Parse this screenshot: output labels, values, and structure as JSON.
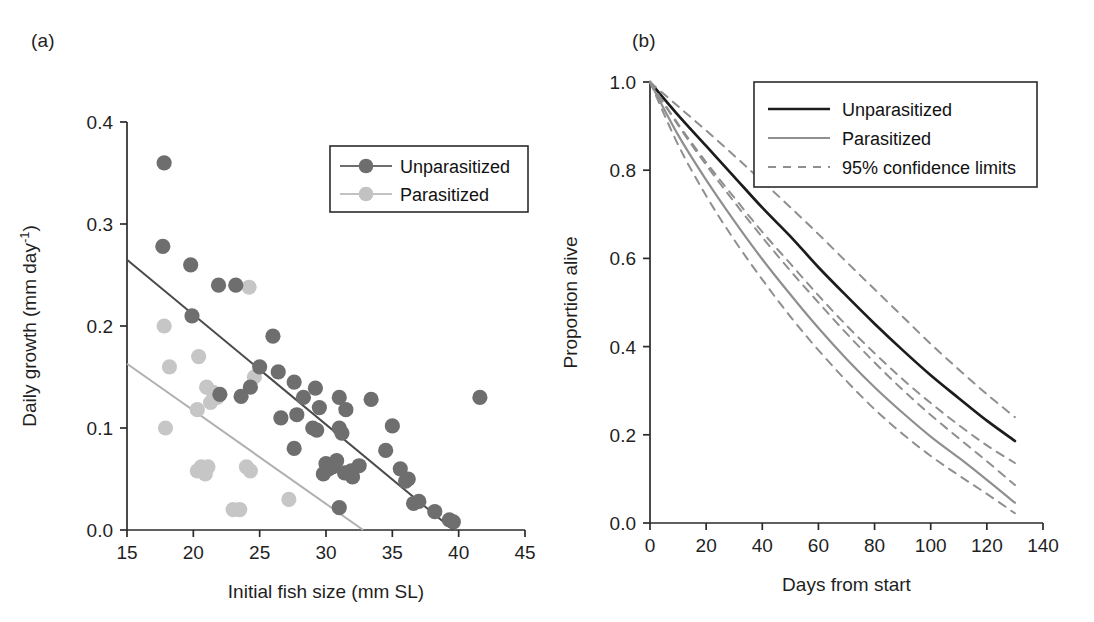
{
  "figure": {
    "panels": [
      {
        "label": "(a)"
      },
      {
        "label": "(b)"
      }
    ]
  },
  "panel_a": {
    "label": "(a)",
    "legend": {
      "items": [
        {
          "label": "Unparasitized",
          "color": "#6e6e6e"
        },
        {
          "label": "Parasitized",
          "color": "#c2c2c2"
        }
      ]
    }
  },
  "panel_b": {
    "label": "(b)",
    "legend": {
      "items": [
        {
          "label": "Unparasitized",
          "color": "#1c1c1c",
          "style": "solid"
        },
        {
          "label": "Parasitized",
          "color": "#8f8f8f",
          "style": "solid"
        },
        {
          "label": "95% confidence limits",
          "color": "#8f8f8f",
          "style": "dashed"
        }
      ]
    }
  },
  "chart_data": [
    {
      "id": "panel-a",
      "type": "scatter",
      "title": "",
      "panel_label": "(a)",
      "xlabel": "Initial fish size (mm SL)",
      "ylabel": "Daily growth (mm day⁻¹)",
      "xlim": [
        15,
        45
      ],
      "ylim": [
        0.0,
        0.4
      ],
      "xticks": [
        15,
        20,
        25,
        30,
        35,
        40,
        45
      ],
      "xtick_labels": [
        "15",
        "20",
        "25",
        "30",
        "35",
        "40",
        "45"
      ],
      "yticks": [
        0.0,
        0.1,
        0.2,
        0.3,
        0.4
      ],
      "ytick_labels": [
        "0.0",
        "0.1",
        "0.2",
        "0.3",
        "0.4"
      ],
      "grid": false,
      "legend_position": "top-right",
      "series": [
        {
          "name": "Unparasitized",
          "color": "#6e6e6e",
          "marker": "circle",
          "points": [
            [
              17.8,
              0.36
            ],
            [
              17.7,
              0.278
            ],
            [
              19.8,
              0.26
            ],
            [
              19.9,
              0.21
            ],
            [
              21.9,
              0.24
            ],
            [
              23.2,
              0.24
            ],
            [
              23.6,
              0.131
            ],
            [
              24.3,
              0.14
            ],
            [
              22.0,
              0.133
            ],
            [
              25.0,
              0.16
            ],
            [
              26.0,
              0.19
            ],
            [
              26.4,
              0.155
            ],
            [
              27.6,
              0.145
            ],
            [
              28.3,
              0.13
            ],
            [
              26.6,
              0.11
            ],
            [
              27.8,
              0.113
            ],
            [
              27.6,
              0.08
            ],
            [
              29.2,
              0.139
            ],
            [
              29.5,
              0.12
            ],
            [
              29.0,
              0.1
            ],
            [
              29.3,
              0.098
            ],
            [
              30.0,
              0.065
            ],
            [
              30.2,
              0.06
            ],
            [
              30.5,
              0.062
            ],
            [
              30.8,
              0.068
            ],
            [
              29.8,
              0.055
            ],
            [
              31.0,
              0.1
            ],
            [
              31.2,
              0.095
            ],
            [
              31.0,
              0.13
            ],
            [
              31.5,
              0.118
            ],
            [
              31.4,
              0.056
            ],
            [
              31.9,
              0.058
            ],
            [
              31.0,
              0.022
            ],
            [
              32.5,
              0.063
            ],
            [
              32.0,
              0.052
            ],
            [
              33.4,
              0.128
            ],
            [
              34.5,
              0.078
            ],
            [
              35.0,
              0.102
            ],
            [
              35.6,
              0.06
            ],
            [
              36.0,
              0.048
            ],
            [
              36.2,
              0.05
            ],
            [
              36.6,
              0.026
            ],
            [
              37.0,
              0.028
            ],
            [
              38.2,
              0.018
            ],
            [
              39.3,
              0.01
            ],
            [
              39.6,
              0.008
            ],
            [
              41.6,
              0.13
            ]
          ]
        },
        {
          "name": "Parasitized",
          "color": "#c6c6c6",
          "marker": "circle",
          "points": [
            [
              17.8,
              0.2
            ],
            [
              18.2,
              0.16
            ],
            [
              17.9,
              0.1
            ],
            [
              20.4,
              0.17
            ],
            [
              21.0,
              0.14
            ],
            [
              21.5,
              0.135
            ],
            [
              21.8,
              0.13
            ],
            [
              21.3,
              0.125
            ],
            [
              20.3,
              0.118
            ],
            [
              20.6,
              0.062
            ],
            [
              20.3,
              0.058
            ],
            [
              20.9,
              0.055
            ],
            [
              21.1,
              0.062
            ],
            [
              23.0,
              0.02
            ],
            [
              23.5,
              0.02
            ],
            [
              24.0,
              0.062
            ],
            [
              24.3,
              0.058
            ],
            [
              24.2,
              0.238
            ],
            [
              27.2,
              0.03
            ],
            [
              24.6,
              0.15
            ]
          ]
        }
      ],
      "fit_lines": [
        {
          "name": "Unparasitized fit",
          "color": "#4a4a4a",
          "x": [
            15.0,
            39.6
          ],
          "y": [
            0.265,
            0.0
          ]
        },
        {
          "name": "Parasitized fit",
          "color": "#b0b0b0",
          "x": [
            15.0,
            32.8
          ],
          "y": [
            0.163,
            0.0
          ]
        }
      ]
    },
    {
      "id": "panel-b",
      "type": "line",
      "title": "",
      "panel_label": "(b)",
      "xlabel": "Days from start",
      "ylabel": "Proportion alive",
      "xlim": [
        0,
        140
      ],
      "ylim": [
        0.0,
        1.0
      ],
      "xticks": [
        0,
        20,
        40,
        60,
        80,
        100,
        120,
        140
      ],
      "xtick_labels": [
        "0",
        "20",
        "40",
        "60",
        "80",
        "100",
        "120",
        "140"
      ],
      "yticks": [
        0.0,
        0.2,
        0.4,
        0.6,
        0.8,
        1.0
      ],
      "ytick_labels": [
        "0.0",
        "0.2",
        "0.4",
        "0.6",
        "0.8",
        "1.0"
      ],
      "grid": false,
      "legend_position": "top-right",
      "x": [
        0,
        10,
        20,
        30,
        40,
        50,
        60,
        70,
        80,
        90,
        100,
        110,
        120,
        130
      ],
      "series": [
        {
          "name": "Unparasitized",
          "color": "#1c1c1c",
          "style": "solid",
          "values": [
            1.0,
            0.925,
            0.855,
            0.785,
            0.715,
            0.65,
            0.58,
            0.515,
            0.452,
            0.392,
            0.335,
            0.283,
            0.232,
            0.186
          ]
        },
        {
          "name": "Unparasitized upper 95% limit",
          "color": "#8f8f8f",
          "style": "dashed",
          "values": [
            1.0,
            0.945,
            0.89,
            0.833,
            0.775,
            0.716,
            0.655,
            0.592,
            0.53,
            0.468,
            0.406,
            0.348,
            0.292,
            0.24
          ]
        },
        {
          "name": "Unparasitized lower 95% limit",
          "color": "#8f8f8f",
          "style": "dashed",
          "values": [
            1.0,
            0.905,
            0.818,
            0.738,
            0.66,
            0.588,
            0.516,
            0.448,
            0.385,
            0.326,
            0.272,
            0.222,
            0.176,
            0.136
          ]
        },
        {
          "name": "Parasitized",
          "color": "#8f8f8f",
          "style": "solid",
          "values": [
            1.0,
            0.88,
            0.778,
            0.685,
            0.598,
            0.518,
            0.442,
            0.372,
            0.308,
            0.25,
            0.196,
            0.148,
            0.098,
            0.046
          ]
        },
        {
          "name": "Parasitized upper 95% limit",
          "color": "#8f8f8f",
          "style": "dashed",
          "values": [
            1.0,
            0.902,
            0.812,
            0.728,
            0.648,
            0.572,
            0.5,
            0.43,
            0.364,
            0.302,
            0.245,
            0.192,
            0.14,
            0.086
          ]
        },
        {
          "name": "Parasitized lower 95% limit",
          "color": "#8f8f8f",
          "style": "dashed",
          "values": [
            1.0,
            0.858,
            0.742,
            0.642,
            0.552,
            0.468,
            0.392,
            0.322,
            0.258,
            0.202,
            0.152,
            0.108,
            0.066,
            0.022
          ]
        }
      ]
    }
  ]
}
